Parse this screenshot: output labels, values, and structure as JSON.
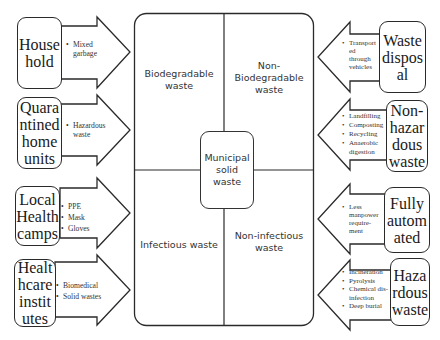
{
  "diagram": {
    "center": {
      "label": "Municipal\nsolid\nwaste"
    },
    "quadrants": [
      {
        "id": "biodegradable",
        "label": "Biodegradable\nwaste"
      },
      {
        "id": "non-biodegradable",
        "label": "Non-\nBiodegradable\nwaste"
      },
      {
        "id": "infectious",
        "label": "Infectious waste"
      },
      {
        "id": "non-infectious",
        "label": "Non-infectious\nwaste"
      }
    ],
    "sources": [
      {
        "label": "House\nhold",
        "items": [
          "Mixed\ngarbage"
        ]
      },
      {
        "label": "Quara\nntined\nhome\nunits",
        "items": [
          "Hazardous\nwaste"
        ]
      },
      {
        "label": "Local\nHealth\ncamps",
        "items": [
          "PPE",
          "Mask",
          "Gloves"
        ]
      },
      {
        "label": "Healt\nhcare\ninstit\nutes",
        "items": [
          "Biomedical",
          "Solid wastes"
        ]
      }
    ],
    "outcomes": [
      {
        "label": "Waste\ndispos\nal",
        "items": [
          "Transport\ned\nthrough\nvehicles"
        ]
      },
      {
        "label": "Non-\nhazar\ndous\nwaste",
        "items": [
          "Landfilling",
          "Composting",
          "Recycling",
          "Anaerobic\ndigestion"
        ]
      },
      {
        "label": "Fully\nautom\nated",
        "items": [
          "Less\nmanpower\nrequire-\nment"
        ]
      },
      {
        "label": "Haza\nrdous\nwaste",
        "items": [
          "Incineration",
          " Pyrolysis",
          "Chemical dis-\ninfection",
          "Deep burial"
        ]
      }
    ]
  }
}
